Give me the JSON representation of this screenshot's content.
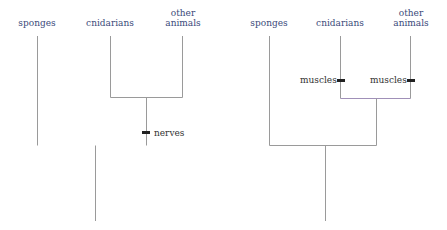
{
  "trees": [
    {
      "id": "left",
      "taxa": [
        {
          "label": "sponges",
          "x": 37
        },
        {
          "label": "cnidarians",
          "x": 110
        },
        {
          "label": "other\nanimals",
          "label_lines": [
            "other",
            "animals"
          ],
          "x": 182
        }
      ],
      "characters": [
        {
          "label": "nerves",
          "branch": "cnidarians+other animals"
        }
      ]
    },
    {
      "id": "right",
      "taxa": [
        {
          "label": "sponges",
          "x": 269
        },
        {
          "label": "cnidarians",
          "x": 340
        },
        {
          "label": "other\nanimals",
          "label_lines": [
            "other",
            "animals"
          ],
          "x": 410
        }
      ],
      "characters": [
        {
          "label": "muscles",
          "branch": "cnidarians"
        },
        {
          "label": "muscles",
          "branch": "other animals"
        }
      ]
    }
  ],
  "colors": {
    "line": "#9a9a9a",
    "marker": "#222222",
    "label": "#3a4a7a",
    "gradient_start": "#e89a9a",
    "gradient_end": "#8fd3e0",
    "purple_hint": "#a58cc0"
  }
}
